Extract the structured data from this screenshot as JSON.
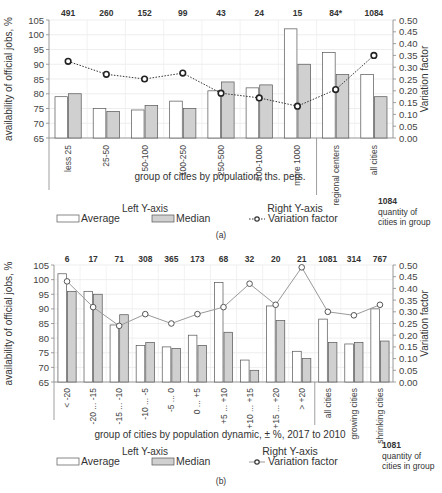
{
  "chart_data": [
    {
      "id": "a",
      "type": "bar",
      "caption": "(a)",
      "xlabel": "group of cities by population, ths. pers.",
      "ylabel": "availability of official jobs, %",
      "y2label": "Variation factor",
      "ylim": [
        65,
        105
      ],
      "yticks": [
        65,
        70,
        75,
        80,
        85,
        90,
        95,
        100,
        105
      ],
      "y2lim": [
        0,
        0.5
      ],
      "y2ticks": [
        "0.00",
        "0.05",
        "0.10",
        "0.15",
        "0.20",
        "0.25",
        "0.30",
        "0.35",
        "0.40",
        "0.45",
        "0.50"
      ],
      "categories": [
        "less 25",
        "25-50",
        "50-100",
        "100-250",
        "250-500",
        "500-1000",
        "more 1000",
        "regional centers",
        "all cities"
      ],
      "counts": [
        "491",
        "260",
        "152",
        "99",
        "43",
        "24",
        "15",
        "84*",
        "1084"
      ],
      "separator_after_index": 6,
      "series": [
        {
          "name": "Average",
          "axis": "left",
          "kind": "bar",
          "color": "#ffffff",
          "values": [
            79,
            75,
            74.5,
            77.5,
            81,
            82,
            102,
            94,
            86.5
          ]
        },
        {
          "name": "Median",
          "axis": "left",
          "kind": "bar",
          "color": "#d0d0d0",
          "values": [
            80,
            74,
            76,
            75,
            84,
            83,
            90,
            86.5,
            79
          ]
        },
        {
          "name": "Variation factor",
          "axis": "right",
          "kind": "line",
          "style": "dotted",
          "color": "#333333",
          "values": [
            0.325,
            0.27,
            0.25,
            0.275,
            0.19,
            0.17,
            0.135,
            0.205,
            0.35
          ]
        }
      ],
      "legend": {
        "left_title": "Left Y-axis",
        "right_title": "Right Y-axis",
        "average": "Average",
        "median": "Median",
        "variation": "Variation factor",
        "count_example": "1084",
        "count_note_1": "quantity of",
        "count_note_2": "cities in group"
      },
      "grid": true
    },
    {
      "id": "b",
      "type": "bar",
      "caption": "(b)",
      "xlabel": "group of cities by population dynamic, ± %, 2017 to 2010",
      "ylabel": "availability of official jobs, %",
      "y2label": "Variation factor",
      "ylim": [
        65,
        105
      ],
      "yticks": [
        65,
        70,
        75,
        80,
        85,
        90,
        95,
        100,
        105
      ],
      "y2lim": [
        0,
        0.5
      ],
      "y2ticks": [
        "0.00",
        "0.05",
        "0.10",
        "0.15",
        "0.20",
        "0.25",
        "0.30",
        "0.35",
        "0.40",
        "0.45",
        "0.50"
      ],
      "categories": [
        "< -20",
        "-20 ... -15",
        "-15 ... -10",
        "-10 ... -5",
        "-5 ... 0",
        "0 ... +5",
        "+5 ... +10",
        "+10 ... +15",
        "+15 ... +20",
        "> +20",
        "all cities",
        "growing cities",
        "shrinking cities"
      ],
      "counts": [
        "6",
        "17",
        "71",
        "308",
        "365",
        "173",
        "68",
        "32",
        "20",
        "21",
        "1081",
        "314",
        "767"
      ],
      "separator_after_index": 9,
      "series": [
        {
          "name": "Average",
          "axis": "left",
          "kind": "bar",
          "color": "#ffffff",
          "values": [
            102,
            96,
            84.5,
            77.5,
            77,
            81,
            99,
            72.5,
            91,
            75.5,
            86.5,
            78,
            90
          ]
        },
        {
          "name": "Median",
          "axis": "left",
          "kind": "bar",
          "color": "#d0d0d0",
          "values": [
            96,
            95,
            88,
            78.5,
            76.5,
            77.5,
            82,
            69,
            86,
            73,
            78.5,
            78.5,
            79
          ]
        },
        {
          "name": "Variation factor",
          "axis": "right",
          "kind": "line",
          "style": "solid",
          "color": "#999999",
          "values": [
            0.43,
            0.32,
            0.24,
            0.29,
            0.25,
            0.29,
            0.32,
            0.42,
            0.33,
            0.49,
            0.3,
            0.285,
            0.33
          ]
        }
      ],
      "legend": {
        "left_title": "Left Y-axis",
        "right_title": "Right Y-axis",
        "average": "Average",
        "median": "Median",
        "variation": "Variation factor",
        "count_example": "1081",
        "count_note_1": "quantity of",
        "count_note_2": "cities in group"
      },
      "grid": true
    }
  ]
}
